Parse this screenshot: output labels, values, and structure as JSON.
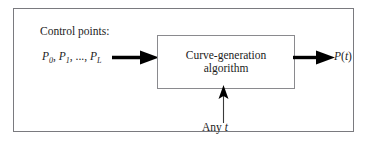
{
  "diagram": {
    "title_caption": "",
    "input_label": "Control points:",
    "input_points": {
      "p0": "P",
      "p0_sub": "0",
      "sep1": ", ",
      "p1": "P",
      "p1_sub": "1",
      "sep2": ", ..., ",
      "pL": "P",
      "pL_sub": "L",
      "full_text": "P0, P1, ..., PL"
    },
    "process_box": {
      "line1": "Curve-generation",
      "line2": "algorithm"
    },
    "output_label": {
      "symbol": "P",
      "open_paren": "(",
      "param": "t",
      "close_paren": ")",
      "full_text": "P(t)"
    },
    "parameter_label": {
      "prefix": "Any ",
      "variable": "t",
      "full_text": "Any t"
    },
    "arrows": [
      {
        "name": "input-arrow",
        "direction": "right",
        "weight": "thick"
      },
      {
        "name": "output-arrow",
        "direction": "right",
        "weight": "thick"
      },
      {
        "name": "parameter-arrow",
        "direction": "up",
        "weight": "thin"
      }
    ],
    "colors": {
      "frame": "#7a7a7f",
      "box_border": "#8a8a8e",
      "text": "#1c1c1c",
      "arrow": "#000000",
      "background": "#ffffff"
    }
  }
}
